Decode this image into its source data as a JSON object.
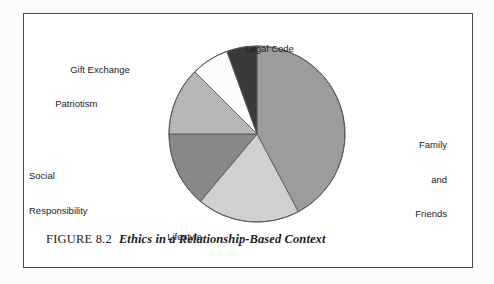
{
  "figure": {
    "caption_number": "FIGURE 8.2",
    "caption_title": "Ethics in a Relationship-Based Context",
    "border_color": "#4a4a4a",
    "background_color": "#ffffff"
  },
  "chart_data": {
    "type": "pie",
    "title": "Ethics in a Relationship-Based Context",
    "xlabel": "",
    "ylabel": "",
    "legend_position": "none",
    "grid": false,
    "start_angle_deg": 0,
    "direction": "clockwise",
    "categories": [
      "Family and Friends",
      "Lifestyle",
      "Social Responsibility",
      "Patriotism",
      "Gift Exchange",
      "Legal Code"
    ],
    "values": [
      42.2,
      18.9,
      13.9,
      12.5,
      7.0,
      5.5
    ],
    "units": "percent",
    "slices": [
      {
        "label": "Family and Friends",
        "label_lines": [
          "Family",
          "and",
          "Friends"
        ],
        "value": 42.2,
        "start_deg": 0,
        "end_deg": 152,
        "color": "#9c9c9c"
      },
      {
        "label": "Lifestyle",
        "label_lines": [
          "Lifestyle"
        ],
        "value": 18.9,
        "start_deg": 152,
        "end_deg": 220,
        "color": "#d0d0d0"
      },
      {
        "label": "Social Responsibility",
        "label_lines": [
          "Social",
          "Responsibility"
        ],
        "value": 13.9,
        "start_deg": 220,
        "end_deg": 270,
        "color": "#888888"
      },
      {
        "label": "Patriotism",
        "label_lines": [
          "Patriotism"
        ],
        "value": 12.5,
        "start_deg": 270,
        "end_deg": 315,
        "color": "#b6b6b6"
      },
      {
        "label": "Gift Exchange",
        "label_lines": [
          "Gift Exchange"
        ],
        "value": 7.0,
        "start_deg": 315,
        "end_deg": 340,
        "color": "#fcfcfc"
      },
      {
        "label": "Legal Code",
        "label_lines": [
          "Legal Code"
        ],
        "value": 5.5,
        "start_deg": 340,
        "end_deg": 360,
        "color": "#3a3a3a"
      }
    ]
  },
  "labels": {
    "legal_code": "Legal Code",
    "gift_exchange": "Gift Exchange",
    "patriotism": "Patriotism",
    "social_responsibility_line1": "Social",
    "social_responsibility_line2": "Responsibility",
    "lifestyle": "Lifestyle",
    "family_line1": "Family",
    "family_line2": "and",
    "family_line3": "Friends"
  }
}
